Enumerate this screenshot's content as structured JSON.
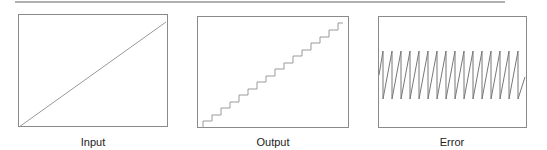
{
  "panels": [
    {
      "id": "input",
      "caption": "Input",
      "signal": "ramp"
    },
    {
      "id": "output",
      "caption": "Output",
      "signal": "staircase",
      "steps": 16
    },
    {
      "id": "error",
      "caption": "Error",
      "signal": "sawtooth",
      "teeth": 16
    }
  ],
  "colors": {
    "frame": "#8a8a8a",
    "trace": "#9a9a9a",
    "error_trace": "#777777",
    "rule": "#b0b0b0"
  }
}
